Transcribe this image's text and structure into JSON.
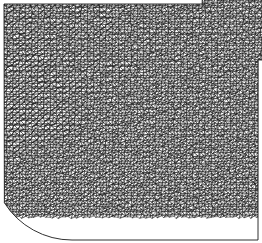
{
  "figure": {
    "name": "finite-element-triangular-mesh",
    "type": "unstructured-triangular-mesh",
    "caption": "",
    "width": 262,
    "height": 243,
    "background_color": "#ffffff",
    "edge_color": "#1a1a1a",
    "fill_color": "#ffffff",
    "edge_width": 0.45,
    "render_style": "wireframe"
  },
  "domain_geometry": {
    "description": "Square plate with a concave circular notch removed from the top-right corner and a convex circular arc trimming the bottom-left corner",
    "base_shape": "square",
    "bounds": {
      "x_min": 4,
      "y_min": 4,
      "x_max": 258,
      "y_max": 240
    },
    "boundary_segments": [
      {
        "name": "top-edge",
        "type": "line",
        "from": [
          4,
          4
        ],
        "to": [
          205,
          4
        ]
      },
      {
        "name": "top-right-concave-arc",
        "type": "arc",
        "from": [
          205,
          4
        ],
        "to": [
          258,
          62
        ],
        "center": [
          262,
          0
        ],
        "radius": 60,
        "curvature": "concave"
      },
      {
        "name": "right-edge",
        "type": "line",
        "from": [
          258,
          62
        ],
        "to": [
          258,
          240
        ]
      },
      {
        "name": "bottom-edge",
        "type": "line",
        "from": [
          258,
          240
        ],
        "to": [
          72,
          240
        ]
      },
      {
        "name": "bottom-left-convex-arc",
        "type": "arc",
        "from": [
          72,
          240
        ],
        "to": [
          4,
          203
        ],
        "center": [
          72,
          160
        ],
        "radius": 80,
        "curvature": "convex"
      },
      {
        "name": "left-edge",
        "type": "line",
        "from": [
          4,
          203
        ],
        "to": [
          4,
          4
        ]
      }
    ]
  },
  "chart_data": {
    "type": "mesh",
    "title": "",
    "xlabel": "",
    "ylabel": "",
    "grid": false,
    "legend": null,
    "element_type": "triangle",
    "approximate_element_count": 11000,
    "approximate_node_count": 5600,
    "nominal_element_size": 3.1,
    "orientation_domains": [
      {
        "name": "left-vertical-band",
        "center": [
          28,
          110
        ],
        "dominant_angle_deg": 88,
        "description": "near-vertical aligned rows along the left edge"
      },
      {
        "name": "upper-left-field",
        "center": [
          85,
          45
        ],
        "dominant_angle_deg": 62,
        "description": "steeply inclined rows in the upper-left region"
      },
      {
        "name": "upper-right-field",
        "center": [
          180,
          45
        ],
        "dominant_angle_deg": 40,
        "description": "diagonal rows fanning toward the notch"
      },
      {
        "name": "central-diagonal-seam",
        "center": [
          140,
          120
        ],
        "dominant_angle_deg": 25,
        "description": "shallow diagonal seam crossing the middle of the plate"
      },
      {
        "name": "lower-left-field",
        "center": [
          60,
          185
        ],
        "dominant_angle_deg": 15,
        "description": "shallow rows curving parallel to the bottom-left arc"
      },
      {
        "name": "lower-right-field",
        "center": [
          200,
          190
        ],
        "dominant_angle_deg": 35,
        "description": "diagonal rows filling the lower-right quadrant"
      }
    ],
    "density_notes": "Uniform element size throughout; apparent tonal variation arises from changing edge orientation relative to the pixel grid rather than from mesh refinement."
  }
}
